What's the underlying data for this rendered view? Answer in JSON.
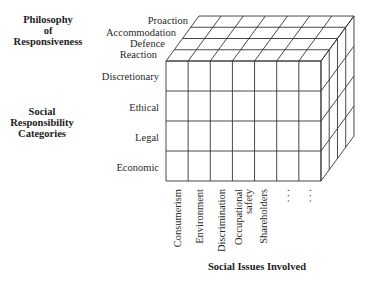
{
  "diagram": {
    "type": "three-dimensional matrix (cube)",
    "axes": {
      "depth": {
        "title_lines": [
          "Philosophy",
          "of",
          "Responsiveness"
        ],
        "levels": [
          "Proaction",
          "Accommodation",
          "Defence",
          "Reaction"
        ]
      },
      "vertical": {
        "title_lines": [
          "Social",
          "Responsibility",
          "Categories"
        ],
        "levels": [
          "Discretionary",
          "Ethical",
          "Legal",
          "Economic"
        ]
      },
      "horizontal": {
        "title": "Social Issues Involved",
        "levels": [
          {
            "lines": [
              "Consumerism"
            ]
          },
          {
            "lines": [
              "Environment"
            ]
          },
          {
            "lines": [
              "Discrimination"
            ]
          },
          {
            "lines": [
              "Occupational",
              "safety"
            ]
          },
          {
            "lines": [
              "Shareholders"
            ]
          },
          {
            "lines": [
              ". . ."
            ]
          },
          {
            "lines": [
              ". . ."
            ]
          }
        ]
      }
    },
    "grid": {
      "columns": 7,
      "rows": 4,
      "depth_layers": 4
    },
    "colors": {
      "line": "#333333",
      "face": "#ffffff",
      "text": "#222222"
    }
  }
}
